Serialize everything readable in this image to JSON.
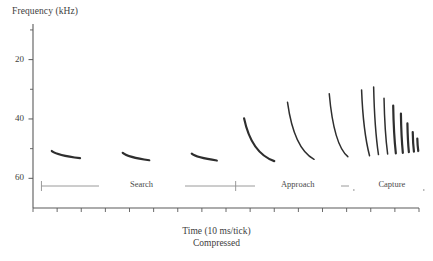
{
  "figure": {
    "y_axis_title": "Frequency (kHz)",
    "x_axis_title": "Time (10 ms/tick)",
    "x_axis_subtitle": "Compressed",
    "y_tick_labels": [
      "60",
      "40",
      "20"
    ],
    "phase_labels": [
      "Search",
      "Approach",
      "Capture"
    ],
    "axis_color": "#5a5a5a",
    "trace_color": "#2e2e2e",
    "phase_bar_color": "#8e8e8e",
    "text_color": "#3d3d3d"
  },
  "chart_data": {
    "type": "line",
    "title": "",
    "subtitle": "",
    "xlabel": "Time (10 ms/tick)",
    "xlabel_note": "Compressed",
    "ylabel": "Frequency (kHz)",
    "ylim": [
      10,
      72
    ],
    "xlim": [
      0,
      16
    ],
    "y_ticks_major": [
      20,
      40,
      60
    ],
    "y_ticks_minor": [
      30,
      50,
      70
    ],
    "x_tick_count": 17,
    "grid": false,
    "legend": "none",
    "annotations": [
      {
        "text": "Search",
        "phase_start_x": 0.35,
        "phase_end_x": 8.4
      },
      {
        "text": "Approach",
        "phase_start_x": 8.4,
        "phase_end_x": 13.3
      },
      {
        "text": "Capture",
        "phase_start_x": 13.3,
        "phase_end_x": 16.2
      }
    ],
    "series": [
      {
        "name": "search-call-1",
        "phase": "Search",
        "curvature": 0.08,
        "x": [
          0.78,
          1.95
        ],
        "y": [
          29.2,
          26.8
        ]
      },
      {
        "name": "search-call-2",
        "phase": "Search",
        "curvature": 0.08,
        "x": [
          3.72,
          4.82
        ],
        "y": [
          28.6,
          26.1
        ]
      },
      {
        "name": "search-call-3",
        "phase": "Search",
        "curvature": 0.08,
        "x": [
          6.58,
          7.62
        ],
        "y": [
          28.3,
          26.0
        ]
      },
      {
        "name": "approach-call-1",
        "phase": "Approach",
        "curvature": 0.62,
        "x": [
          8.75,
          10.0
        ],
        "y": [
          40.2,
          25.8
        ]
      },
      {
        "name": "approach-call-2",
        "phase": "Approach",
        "curvature": 0.62,
        "x": [
          10.55,
          11.65
        ],
        "y": [
          45.6,
          26.4
        ]
      },
      {
        "name": "approach-call-3",
        "phase": "Approach",
        "curvature": 0.62,
        "x": [
          12.28,
          13.05
        ],
        "y": [
          48.5,
          27.3
        ]
      },
      {
        "name": "capture-buzz-1",
        "phase": "Capture",
        "curvature": 0.18,
        "x": [
          13.62,
          13.95
        ],
        "y": [
          49.8,
          27.6
        ]
      },
      {
        "name": "capture-buzz-2",
        "phase": "Capture",
        "curvature": 0.14,
        "x": [
          14.12,
          14.32
        ],
        "y": [
          50.8,
          28.0
        ]
      },
      {
        "name": "capture-buzz-3",
        "phase": "Capture",
        "curvature": 0.12,
        "x": [
          14.55,
          14.7
        ],
        "y": [
          47.0,
          28.2
        ]
      },
      {
        "name": "capture-buzz-4",
        "phase": "Capture",
        "curvature": 0.1,
        "x": [
          14.93,
          15.04
        ],
        "y": [
          44.5,
          28.4
        ]
      },
      {
        "name": "capture-buzz-5",
        "phase": "Capture",
        "curvature": 0.09,
        "x": [
          15.25,
          15.33
        ],
        "y": [
          41.8,
          28.6
        ]
      },
      {
        "name": "capture-buzz-6",
        "phase": "Capture",
        "curvature": 0.08,
        "x": [
          15.52,
          15.58
        ],
        "y": [
          38.5,
          28.8
        ]
      },
      {
        "name": "capture-buzz-7",
        "phase": "Capture",
        "curvature": 0.07,
        "x": [
          15.74,
          15.79
        ],
        "y": [
          35.6,
          29.0
        ]
      },
      {
        "name": "capture-buzz-8",
        "phase": "Capture",
        "curvature": 0.06,
        "x": [
          15.93,
          15.97
        ],
        "y": [
          33.4,
          29.2
        ]
      }
    ]
  }
}
